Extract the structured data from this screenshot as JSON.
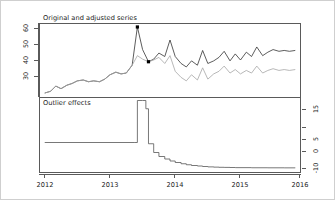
{
  "figure": {
    "panels": [
      {
        "name": "top",
        "title": "Original and adjusted series"
      },
      {
        "name": "bottom",
        "title": "Outlier effects"
      }
    ],
    "x_axis": {
      "labels": [
        "2012",
        "2013",
        "2014",
        "2015",
        "2016"
      ]
    },
    "y_axis_top": {
      "labels": [
        "60",
        "50",
        "40",
        "30"
      ]
    },
    "y_axis_bottom": {
      "labels": [
        "15",
        "5",
        "0",
        "-10"
      ]
    }
  },
  "chart_data": [
    {
      "type": "line",
      "name": "original-and-adjusted-series",
      "title": "Original and adjusted series",
      "xlabel": "",
      "ylabel": "",
      "xlim": [
        2012.0,
        2016.0
      ],
      "ylim": [
        25,
        67
      ],
      "xticks": [
        2012,
        2013,
        2014,
        2015,
        2016
      ],
      "yticks": [
        30,
        40,
        50,
        60
      ],
      "grid": false,
      "legend": "none",
      "annotations": [
        {
          "label": "outlier point",
          "x": 2013.5,
          "y": 65.0
        },
        {
          "label": "outlier point",
          "x": 2013.67,
          "y": 45.0
        }
      ],
      "series": [
        {
          "name": "Original series",
          "color": "#333333",
          "x": [
            2012.08,
            2012.17,
            2012.25,
            2012.33,
            2012.42,
            2012.5,
            2012.58,
            2012.67,
            2012.75,
            2012.83,
            2012.92,
            2013.0,
            2013.08,
            2013.17,
            2013.25,
            2013.33,
            2013.42,
            2013.5,
            2013.58,
            2013.67,
            2013.75,
            2013.83,
            2013.92,
            2014.0,
            2014.08,
            2014.17,
            2014.25,
            2014.33,
            2014.42,
            2014.5,
            2014.58,
            2014.67,
            2014.75,
            2014.83,
            2014.92,
            2015.0,
            2015.08,
            2015.17,
            2015.25,
            2015.33,
            2015.42,
            2015.5,
            2015.58,
            2015.67,
            2015.75,
            2015.83,
            2015.92
          ],
          "y": [
            27.0,
            28.0,
            31.0,
            29.5,
            31.5,
            32.5,
            34.0,
            34.5,
            33.5,
            34.0,
            33.5,
            35.0,
            37.5,
            39.0,
            38.0,
            38.5,
            43.0,
            65.0,
            52.0,
            45.0,
            46.5,
            50.0,
            48.0,
            57.5,
            48.0,
            44.0,
            42.0,
            45.5,
            43.0,
            51.5,
            44.0,
            45.5,
            47.5,
            51.0,
            45.5,
            49.5,
            46.0,
            50.5,
            48.0,
            53.5,
            48.5,
            50.5,
            52.0,
            51.0,
            51.5,
            51.0,
            51.5
          ]
        },
        {
          "name": "Adjusted series",
          "color": "#a6a6a6",
          "x": [
            2012.08,
            2012.17,
            2012.25,
            2012.33,
            2012.42,
            2012.5,
            2012.58,
            2012.67,
            2012.75,
            2012.83,
            2012.92,
            2013.0,
            2013.08,
            2013.17,
            2013.25,
            2013.33,
            2013.42,
            2013.5,
            2013.58,
            2013.67,
            2013.75,
            2013.83,
            2013.92,
            2014.0,
            2014.08,
            2014.17,
            2014.25,
            2014.33,
            2014.42,
            2014.5,
            2014.58,
            2014.67,
            2014.75,
            2014.83,
            2014.92,
            2015.0,
            2015.08,
            2015.17,
            2015.25,
            2015.33,
            2015.42,
            2015.5,
            2015.58,
            2015.67,
            2015.75,
            2015.83,
            2015.92
          ],
          "y": [
            27.0,
            28.0,
            31.0,
            29.5,
            31.5,
            32.5,
            34.0,
            34.5,
            33.5,
            34.0,
            33.5,
            35.0,
            37.5,
            39.0,
            38.0,
            38.5,
            43.0,
            48.5,
            46.5,
            45.0,
            46.0,
            47.5,
            44.0,
            48.5,
            39.5,
            36.0,
            34.0,
            37.5,
            34.5,
            41.5,
            35.0,
            38.0,
            39.5,
            42.5,
            38.5,
            40.5,
            38.0,
            40.0,
            38.5,
            42.5,
            38.5,
            40.0,
            41.0,
            40.0,
            40.5,
            40.0,
            40.5
          ]
        }
      ]
    },
    {
      "type": "line",
      "name": "outlier-effects",
      "title": "Outlier effects",
      "xlabel": "",
      "ylabel": "",
      "xlim": [
        2012.0,
        2016.0
      ],
      "ylim": [
        -12,
        18
      ],
      "xticks": [
        2012,
        2013,
        2014,
        2015,
        2016
      ],
      "yticks": [
        -10,
        0,
        5,
        15
      ],
      "grid": false,
      "legend": "none",
      "step": true,
      "series": [
        {
          "name": "Outlier effect",
          "color": "#555555",
          "x": [
            2012.08,
            2013.45,
            2013.5,
            2013.58,
            2013.63,
            2013.67,
            2013.75,
            2013.83,
            2013.92,
            2014.0,
            2014.08,
            2014.17,
            2014.25,
            2014.33,
            2014.42,
            2014.5,
            2014.58,
            2014.67,
            2014.75,
            2014.83,
            2014.92,
            2015.0,
            2015.25,
            2015.5,
            2015.75,
            2015.92
          ],
          "y": [
            0.0,
            0.0,
            16.8,
            16.8,
            13.5,
            -0.5,
            -4.0,
            -5.6,
            -6.6,
            -7.4,
            -8.0,
            -8.5,
            -8.9,
            -9.2,
            -9.4,
            -9.6,
            -9.75,
            -9.85,
            -9.92,
            -9.96,
            -10.0,
            -10.05,
            -10.1,
            -10.12,
            -10.14,
            -10.15
          ]
        }
      ]
    }
  ]
}
